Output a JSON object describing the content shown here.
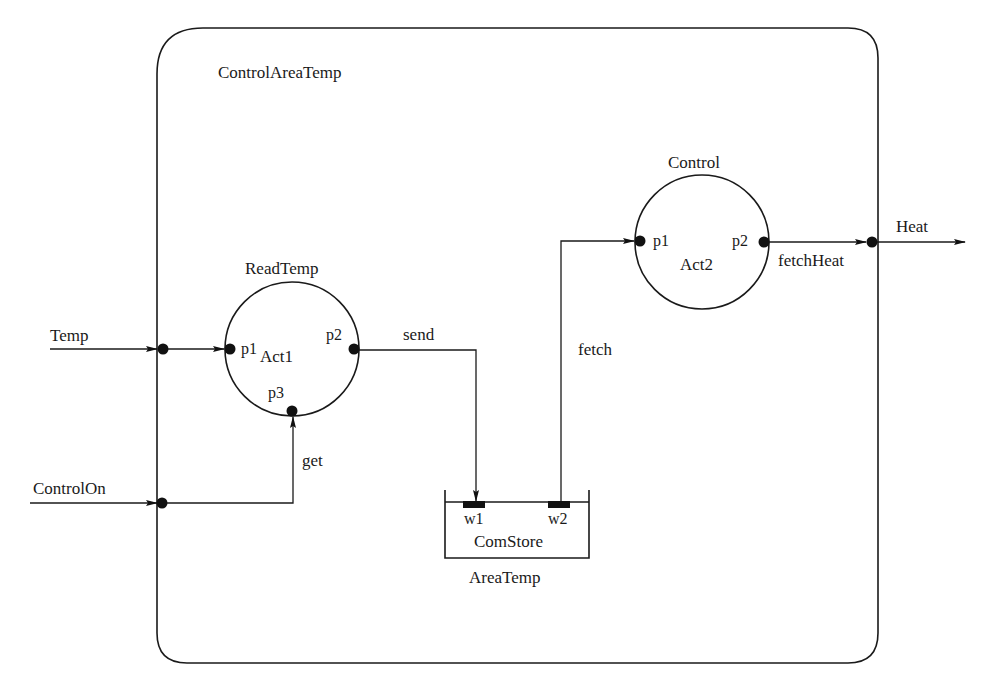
{
  "diagram": {
    "title": "ControlAreaTemp",
    "colors": {
      "line": "#1a1a1a",
      "background": "#ffffff"
    },
    "external_inputs": [
      {
        "id": "temp",
        "label": "Temp"
      },
      {
        "id": "control_on",
        "label": "ControlOn"
      }
    ],
    "external_outputs": [
      {
        "id": "heat",
        "label": "Heat"
      }
    ],
    "activities": [
      {
        "id": "readtemp",
        "name": "ReadTemp",
        "instance": "Act1",
        "ports": {
          "p1": "p1",
          "p2": "p2",
          "p3": "p3"
        }
      },
      {
        "id": "control",
        "name": "Control",
        "instance": "Act2",
        "ports": {
          "p1": "p1",
          "p2": "p2"
        }
      }
    ],
    "store": {
      "name": "AreaTemp",
      "instance": "ComStore",
      "ports": {
        "w1": "w1",
        "w2": "w2"
      }
    },
    "connections": [
      {
        "label": "send",
        "from": "Act1.p2",
        "to": "ComStore.w1"
      },
      {
        "label": "fetch",
        "from": "ComStore.w2",
        "to": "Act2.p1"
      },
      {
        "label": "get",
        "from": "ControlOn",
        "to": "Act1.p3"
      },
      {
        "label": "fetchHeat",
        "from": "Act2.p2",
        "to": "Heat"
      }
    ]
  }
}
